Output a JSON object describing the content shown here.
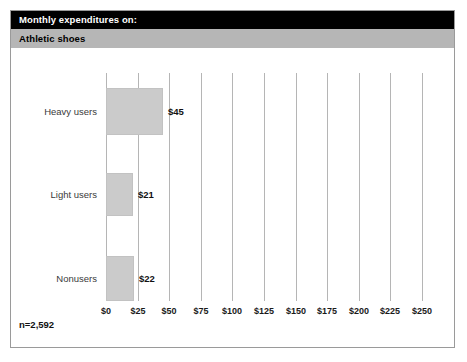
{
  "header": {
    "title": "Monthly expenditures on:",
    "subtitle": "Athletic shoes",
    "title_bg": "#000000",
    "title_fg": "#ffffff",
    "subtitle_bg": "#b6b6b6",
    "subtitle_fg": "#000000"
  },
  "footer": {
    "note": "n=2,592"
  },
  "chart_data": {
    "type": "bar",
    "orientation": "horizontal",
    "title": "Monthly expenditures on:",
    "subtitle": "Athletic shoes",
    "categories": [
      "Heavy users",
      "Light users",
      "Nonusers"
    ],
    "values": [
      45,
      21,
      22
    ],
    "value_labels": [
      "$45",
      "$21",
      "$22"
    ],
    "xlabel": "",
    "ylabel": "",
    "xlim": [
      0,
      250
    ],
    "xticks": [
      0,
      25,
      50,
      75,
      100,
      125,
      150,
      175,
      200,
      225,
      250
    ],
    "xtick_labels": [
      "$0",
      "$25",
      "$50",
      "$75",
      "$100",
      "$125",
      "$150",
      "$175",
      "$200",
      "$225",
      "$250"
    ],
    "grid": "vertical",
    "legend": "none",
    "bar_color": "#cbcbcb",
    "gridline_color": "#b5b5b5",
    "annotation": "n=2,592"
  }
}
